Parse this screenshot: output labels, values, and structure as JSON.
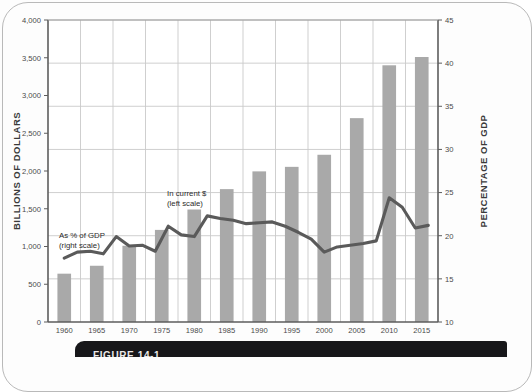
{
  "figure": {
    "caption": "FIGURE 14-1",
    "left_axis_title": "BILLIONS OF DOLLARS",
    "right_axis_title": "PERCENTAGE OF GDP"
  },
  "annotations": {
    "bars_label_line1": "In current $",
    "bars_label_line2": "(left scale)",
    "line_label_line1": "As % of GDP",
    "line_label_line2": "(right scale)"
  },
  "colors": {
    "bar_fill": "#a9a9a9",
    "line_stroke": "#5a5a5a",
    "grid": "#c9c9c9",
    "axis": "#5d5d5d",
    "plot_background": "#ffffff",
    "caption_background": "#17171a"
  },
  "chart_data": {
    "type": "bar",
    "title": "",
    "subtitle": "",
    "xlabel": "",
    "ylabel": "BILLIONS OF DOLLARS",
    "y2label": "PERCENTAGE OF GDP",
    "grid": true,
    "legend_position": "inline-annotations",
    "categories": [
      "1960",
      "1965",
      "1970",
      "1975",
      "1980",
      "1985",
      "1990",
      "1995",
      "2000",
      "2005",
      "2010",
      "2015"
    ],
    "x_tick_labels": [
      "1960",
      "1965",
      "1970",
      "1975",
      "1980",
      "1985",
      "1990",
      "1995",
      "2000",
      "2005",
      "2010",
      "2015"
    ],
    "ylim": [
      0,
      4000
    ],
    "y_tick_labels": [
      "0",
      "500",
      "1,000",
      "1,500",
      "2,000",
      "2,500",
      "3,000",
      "3,500",
      "4,000"
    ],
    "y_ticks": [
      0,
      500,
      1000,
      1500,
      2000,
      2500,
      3000,
      3500,
      4000
    ],
    "y2lim": [
      10,
      45
    ],
    "y2_tick_labels": [
      "10",
      "15",
      "20",
      "25",
      "30",
      "35",
      "40",
      "45"
    ],
    "y2_ticks": [
      10,
      15,
      20,
      25,
      30,
      35,
      40,
      45
    ],
    "series": [
      {
        "name": "In current $ (left scale)",
        "type": "bar",
        "axis": "left",
        "unit": "billions of dollars",
        "values": [
          640,
          745,
          1010,
          1220,
          1490,
          1760,
          1995,
          2055,
          2215,
          2700,
          3400,
          3510
        ]
      },
      {
        "name": "As % of GDP (right scale)",
        "type": "line",
        "axis": "right",
        "unit": "percent of GDP",
        "x": [
          1960,
          1962,
          1964,
          1966,
          1968,
          1970,
          1972,
          1974,
          1976,
          1978,
          1980,
          1982,
          1984,
          1986,
          1988,
          1990,
          1992,
          1994,
          1996,
          1998,
          2000,
          2002,
          2004,
          2006,
          2008,
          2010,
          2012,
          2014,
          2016
        ],
        "values": [
          17.4,
          18.1,
          18.2,
          17.9,
          19.9,
          18.8,
          18.9,
          18.2,
          21.1,
          20.1,
          19.9,
          22.3,
          22.0,
          21.8,
          21.4,
          21.5,
          21.6,
          21.1,
          20.4,
          19.6,
          18.1,
          18.7,
          18.9,
          19.1,
          19.4,
          24.4,
          23.3,
          20.9,
          21.2
        ]
      }
    ]
  }
}
